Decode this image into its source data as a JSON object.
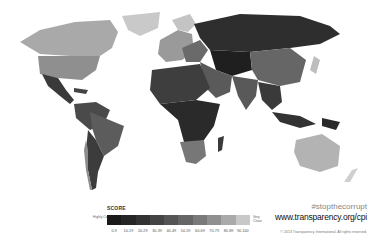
{
  "map": {
    "title": "Corruption Perceptions Index world map",
    "regions": [
      {
        "name": "Greenland",
        "shade": "#c9c9c9"
      },
      {
        "name": "Canada",
        "shade": "#a9a9a9"
      },
      {
        "name": "United States",
        "shade": "#8f8f8f"
      },
      {
        "name": "Mexico & Central America",
        "shade": "#3a3a3a"
      },
      {
        "name": "South America",
        "shade": "#4a4a4a"
      },
      {
        "name": "Brazil",
        "shade": "#5c5c5c"
      },
      {
        "name": "Chile",
        "shade": "#8c8c8c"
      },
      {
        "name": "Europe West",
        "shade": "#9a9a9a"
      },
      {
        "name": "Scandinavia",
        "shade": "#c4c4c4"
      },
      {
        "name": "Russia",
        "shade": "#2e2e2e"
      },
      {
        "name": "Middle East",
        "shade": "#5a5a5a"
      },
      {
        "name": "Central Asia",
        "shade": "#1f1f1f"
      },
      {
        "name": "China",
        "shade": "#666666"
      },
      {
        "name": "India",
        "shade": "#595959"
      },
      {
        "name": "Southeast Asia",
        "shade": "#3a3a3a"
      },
      {
        "name": "North Africa",
        "shade": "#3e3e3e"
      },
      {
        "name": "Sub-Saharan Africa",
        "shade": "#2a2a2a"
      },
      {
        "name": "Southern Africa",
        "shade": "#777777"
      },
      {
        "name": "Australia",
        "shade": "#b3b3b3"
      },
      {
        "name": "New Zealand",
        "shade": "#cfcfcf"
      },
      {
        "name": "Japan",
        "shade": "#bdbdbd"
      }
    ]
  },
  "legend": {
    "title": "SCORE",
    "low_label": "Highly Corrupt",
    "high_label": "Very Clean",
    "colors": [
      "#1a1a1a",
      "#262626",
      "#333333",
      "#444444",
      "#555555",
      "#666666",
      "#7a7a7a",
      "#909090",
      "#aaaaaa",
      "#c8c8c8"
    ],
    "ticks": [
      "0-9",
      "10-19",
      "20-29",
      "30-39",
      "40-49",
      "50-59",
      "60-69",
      "70-79",
      "80-89",
      "90-100"
    ]
  },
  "footer": {
    "hashtag": "#stopthecorrupt",
    "url": "www.transparency.org/cpi",
    "copyright": "© 2013 Transparency International. All rights reserved."
  }
}
